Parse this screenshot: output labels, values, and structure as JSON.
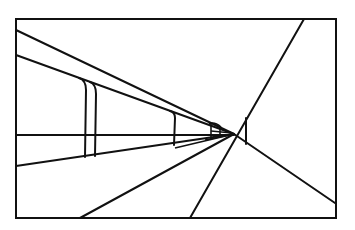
{
  "figure": {
    "type": "one-point perspective line drawing",
    "stroke_color": "#111111",
    "background": "#ffffff",
    "frame": {
      "x1": 16,
      "y1": 19,
      "x2": 336,
      "y2": 218
    },
    "vanishing_point": {
      "x": 234,
      "y": 134
    },
    "lines": [
      {
        "name": "upper-beam-top",
        "x1": 16,
        "y1": 30,
        "x2": 234,
        "y2": 134
      },
      {
        "name": "upper-beam-bottom",
        "x1": 16,
        "y1": 55,
        "x2": 234,
        "y2": 134
      },
      {
        "name": "horizon-line",
        "x1": 16,
        "y1": 135,
        "x2": 234,
        "y2": 135
      },
      {
        "name": "floor-edge",
        "x1": 16,
        "y1": 166,
        "x2": 234,
        "y2": 134
      },
      {
        "name": "lower-left-diagonal",
        "x1": 80,
        "y1": 218,
        "x2": 234,
        "y2": 134
      },
      {
        "name": "steep-diagonal",
        "x1": 190,
        "y1": 218,
        "x2": 304,
        "y2": 19
      },
      {
        "name": "right-diagonal",
        "x1": 234,
        "y1": 134,
        "x2": 335,
        "y2": 203
      }
    ]
  }
}
